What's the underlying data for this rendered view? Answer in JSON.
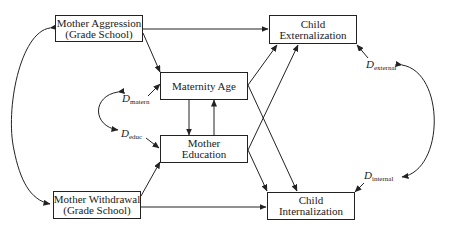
{
  "diagram": {
    "type": "path-diagram",
    "nodes": {
      "mother_aggression": {
        "line1": "Mother Aggression",
        "line2": "(Grade School)"
      },
      "mother_withdrawal": {
        "line1": "Mother Withdrawal",
        "line2": "(Grade School)"
      },
      "maternity_age": {
        "line1": "Maternity Age"
      },
      "mother_education": {
        "line1": "Mother",
        "line2": "Education"
      },
      "child_externalization": {
        "line1": "Child",
        "line2": "Externalization"
      },
      "child_internalization": {
        "line1": "Child",
        "line2": "Internalization"
      }
    },
    "disturbances": {
      "d_matern": {
        "symbol": "D",
        "subscript": "matern"
      },
      "d_educ": {
        "symbol": "D",
        "subscript": "educ"
      },
      "d_external": {
        "symbol": "D",
        "subscript": "external"
      },
      "d_internal": {
        "symbol": "D",
        "subscript": "internal"
      }
    },
    "edges": [
      {
        "from": "Mother Aggression",
        "to": "Child Externalization",
        "type": "directed"
      },
      {
        "from": "Mother Aggression",
        "to": "Maternity Age",
        "type": "directed"
      },
      {
        "from": "Mother Withdrawal",
        "to": "Mother Education",
        "type": "directed"
      },
      {
        "from": "Mother Withdrawal",
        "to": "Child Internalization",
        "type": "directed"
      },
      {
        "from": "Maternity Age",
        "to": "Mother Education",
        "type": "directed"
      },
      {
        "from": "Mother Education",
        "to": "Maternity Age",
        "type": "directed"
      },
      {
        "from": "Maternity Age",
        "to": "Child Externalization",
        "type": "directed"
      },
      {
        "from": "Maternity Age",
        "to": "Child Internalization",
        "type": "directed"
      },
      {
        "from": "Mother Education",
        "to": "Child Externalization",
        "type": "directed"
      },
      {
        "from": "Mother Education",
        "to": "Child Internalization",
        "type": "directed"
      },
      {
        "from": "D_matern",
        "to": "Maternity Age",
        "type": "directed"
      },
      {
        "from": "D_educ",
        "to": "Mother Education",
        "type": "directed"
      },
      {
        "from": "D_external",
        "to": "Child Externalization",
        "type": "directed"
      },
      {
        "from": "D_internal",
        "to": "Child Internalization",
        "type": "directed"
      },
      {
        "from": "Mother Aggression",
        "to": "Mother Withdrawal",
        "type": "covariance"
      },
      {
        "from": "D_matern",
        "to": "D_educ",
        "type": "covariance"
      },
      {
        "from": "D_external",
        "to": "D_internal",
        "type": "covariance"
      }
    ]
  }
}
